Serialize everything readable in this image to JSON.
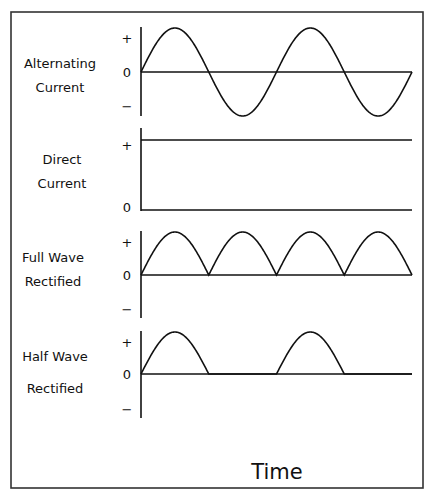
{
  "figure": {
    "x_axis_label": "Time",
    "line_color": "#111111",
    "background": "#ffffff"
  },
  "panels": [
    {
      "id": "alternating-current",
      "title_lines": [
        "Alternating",
        "Current"
      ],
      "waveform": "sine",
      "cycles": 2,
      "ticks": {
        "plus": "+",
        "zero": "0",
        "minus": "−"
      }
    },
    {
      "id": "direct-current",
      "title_lines": [
        "Direct",
        "Current"
      ],
      "waveform": "constant",
      "level": 1,
      "ticks": {
        "plus": "+",
        "zero": "0"
      }
    },
    {
      "id": "full-wave-rectified",
      "title_lines": [
        "Full Wave",
        "Rectified"
      ],
      "waveform": "full-wave-rectified",
      "half_cycles": 4,
      "ticks": {
        "plus": "+",
        "zero": "0",
        "minus": "−"
      }
    },
    {
      "id": "half-wave-rectified",
      "title_lines": [
        "Half Wave",
        "Rectified"
      ],
      "waveform": "half-wave-rectified",
      "half_cycles": 4,
      "ticks": {
        "plus": "+",
        "zero": "0",
        "minus": "−"
      }
    }
  ]
}
